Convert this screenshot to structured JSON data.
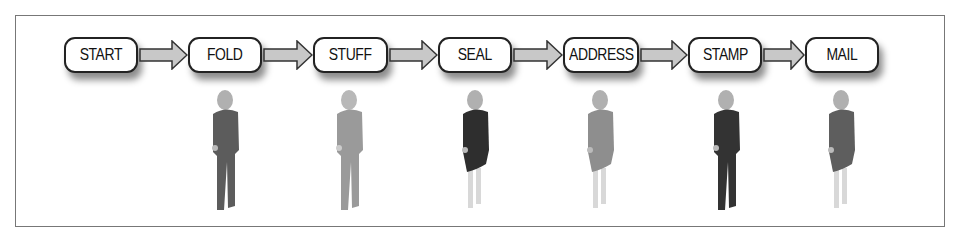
{
  "diagram": {
    "steps": [
      {
        "label": "START",
        "left": 64,
        "width": 74
      },
      {
        "label": "FOLD",
        "left": 188,
        "width": 74
      },
      {
        "label": "STUFF",
        "left": 313,
        "width": 75
      },
      {
        "label": "SEAL",
        "left": 438,
        "width": 74
      },
      {
        "label": "ADDRESS",
        "left": 563,
        "width": 76
      },
      {
        "label": "STAMP",
        "left": 688,
        "width": 74
      },
      {
        "label": "MAIL",
        "left": 805,
        "width": 74
      }
    ],
    "people": [
      {
        "step": "FOLD",
        "body": "#5c5c5c",
        "legs": "#5c5c5c",
        "dress": false
      },
      {
        "step": "STUFF",
        "body": "#9a9a9a",
        "legs": "#a8a8a8",
        "dress": false
      },
      {
        "step": "SEAL",
        "body": "#2e2e2e",
        "legs": "#d8d8d8",
        "dress": true
      },
      {
        "step": "ADDRESS",
        "body": "#8e8e8e",
        "legs": "#d8d8d8",
        "dress": true
      },
      {
        "step": "STAMP",
        "body": "#333333",
        "legs": "#333333",
        "dress": false
      },
      {
        "step": "MAIL",
        "body": "#5e5e5e",
        "legs": "#d8d8d8",
        "dress": true
      }
    ],
    "colors": {
      "arrow_fill": "#c8c8c8",
      "arrow_stroke": "#333333",
      "box_border": "#222222",
      "frame_border": "#777777"
    }
  }
}
